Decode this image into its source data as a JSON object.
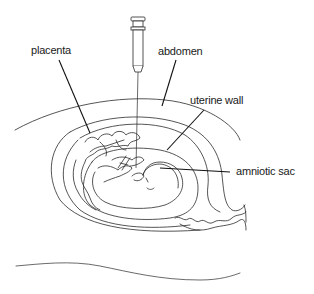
{
  "diagram": {
    "type": "anatomical-illustration",
    "labels": {
      "placenta": "placenta",
      "abdomen": "abdomen",
      "uterine_wall": "uterine wall",
      "amniotic_sac": "amniotic sac"
    },
    "elements": [
      {
        "name": "syringe",
        "description": "syringe with needle inserted through abdomen into amniotic sac"
      },
      {
        "name": "abdomen",
        "description": "outer abdominal wall curve"
      },
      {
        "name": "uterine-wall",
        "description": "uterine wall layers"
      },
      {
        "name": "placenta",
        "description": "wavy placental tissue lining upper-left uterus"
      },
      {
        "name": "amniotic-sac",
        "description": "fluid sac surrounding fetus"
      },
      {
        "name": "fetus",
        "description": "fetus curled inside amniotic sac"
      },
      {
        "name": "back-curve",
        "description": "lower body outline curve"
      }
    ],
    "colors": {
      "line": "#2a2a2a",
      "leader": "#111111",
      "background": "#ffffff"
    }
  }
}
